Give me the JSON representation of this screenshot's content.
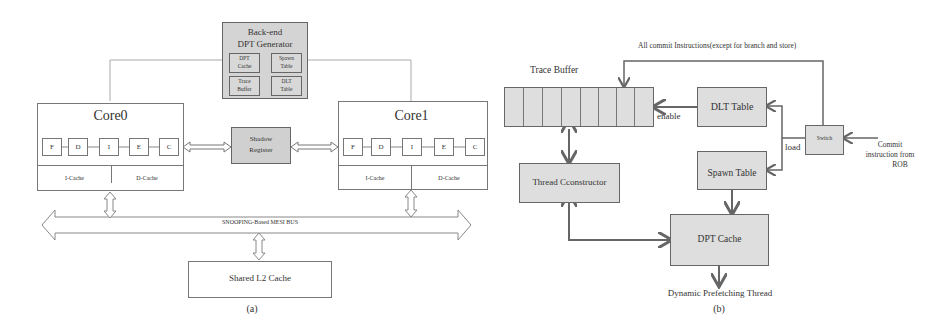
{
  "diagram_a": {
    "caption": "(a)",
    "backend": {
      "title_line1": "Back-end",
      "title_line2": "DPT Generator",
      "cells": [
        {
          "line1": "DPT",
          "line2": "Cache"
        },
        {
          "line1": "Spawn",
          "line2": "Table"
        },
        {
          "line1": "Trace",
          "line2": "Buffer"
        },
        {
          "line1": "DLT",
          "line2": "Table"
        }
      ]
    },
    "core0": {
      "title": "Core0",
      "stages": [
        "F",
        "D",
        "I",
        "E",
        "C"
      ],
      "icache": "I-Cache",
      "dcache": "D-Cache"
    },
    "core1": {
      "title": "Core1",
      "stages": [
        "F",
        "D",
        "I",
        "E",
        "C"
      ],
      "icache": "I-Cache",
      "dcache": "D-Cache"
    },
    "shadow_register": {
      "line1": "Shadow",
      "line2": "Register"
    },
    "bus_label": "SNOOPING-Based MESI BUS",
    "l2_cache": "Shared L2 Cache"
  },
  "diagram_b": {
    "caption": "(b)",
    "top_label": "All commit Instructions(except for branch and store)",
    "trace_buffer_label": "Trace Buffer",
    "trace_buffer_cells": 8,
    "dlt_table": "DLT Table",
    "spawn_table": "Spawn Table",
    "switch": "Switch",
    "enable_label": "enable",
    "load_label": "load",
    "commit_label_line1": "Commit",
    "commit_label_line2": "instruction from",
    "commit_label_line3": "ROB",
    "thread_constructor": "Thread Cconstructor",
    "dpt_cache": "DPT Cache",
    "output_label": "Dynamic Prefetching Thread"
  }
}
